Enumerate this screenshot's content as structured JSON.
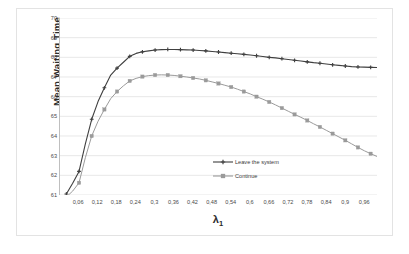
{
  "chart_data": {
    "type": "line",
    "title": "",
    "xlabel": "λ₁",
    "xlabel_base": "λ",
    "xlabel_sub": "1",
    "ylabel": "Mean Waiting Time",
    "xlim": [
      0,
      1.0
    ],
    "ylim": [
      61,
      70
    ],
    "grid": "horizontal",
    "legend_position": "center-right-inside",
    "x_tick_labels": [
      "0,06",
      "0,12",
      "0,18",
      "0,24",
      "0,3",
      "0,36",
      "0,42",
      "0,48",
      "0,54",
      "0,6",
      "0,66",
      "0,72",
      "0,78",
      "0,84",
      "0,9",
      "0,96"
    ],
    "y_tick_labels": [
      "70",
      "69",
      "68",
      "67",
      "66",
      "65",
      "64",
      "63",
      "62",
      "61"
    ],
    "y_ticks": [
      70,
      69,
      68,
      67,
      66,
      65,
      64,
      63,
      62,
      61
    ],
    "x": [
      0.02,
      0.04,
      0.06,
      0.08,
      0.1,
      0.12,
      0.14,
      0.16,
      0.18,
      0.2,
      0.22,
      0.24,
      0.26,
      0.28,
      0.3,
      0.32,
      0.34,
      0.36,
      0.38,
      0.4,
      0.42,
      0.44,
      0.46,
      0.48,
      0.5,
      0.52,
      0.54,
      0.56,
      0.58,
      0.6,
      0.62,
      0.64,
      0.66,
      0.68,
      0.7,
      0.72,
      0.74,
      0.76,
      0.78,
      0.8,
      0.82,
      0.84,
      0.86,
      0.88,
      0.9,
      0.92,
      0.94,
      0.96,
      0.98,
      1.0
    ],
    "series": [
      {
        "name": "Leave the system",
        "color": "#3f3f3f",
        "marker": "cross",
        "values": [
          61.05,
          61.6,
          62.2,
          63.6,
          64.85,
          65.75,
          66.45,
          67.1,
          67.45,
          67.75,
          68.05,
          68.2,
          68.28,
          68.33,
          68.37,
          68.39,
          68.4,
          68.4,
          68.39,
          68.38,
          68.37,
          68.35,
          68.33,
          68.3,
          68.27,
          68.24,
          68.21,
          68.18,
          68.15,
          68.12,
          68.08,
          68.04,
          68.0,
          67.97,
          67.93,
          67.89,
          67.85,
          67.81,
          67.77,
          67.73,
          67.7,
          67.66,
          67.62,
          67.59,
          67.56,
          67.53,
          67.51,
          67.5,
          67.49,
          67.48
        ]
      },
      {
        "name": "Continue",
        "color": "#9a9a9a",
        "marker": "square",
        "values": [
          60.9,
          61.2,
          61.62,
          62.9,
          64.0,
          64.75,
          65.35,
          65.9,
          66.26,
          66.55,
          66.8,
          66.93,
          67.02,
          67.07,
          67.1,
          67.11,
          67.1,
          67.08,
          67.04,
          67.0,
          66.95,
          66.9,
          66.83,
          66.75,
          66.67,
          66.58,
          66.49,
          66.38,
          66.26,
          66.14,
          66.0,
          65.87,
          65.73,
          65.58,
          65.42,
          65.26,
          65.1,
          64.95,
          64.79,
          64.62,
          64.46,
          64.29,
          64.12,
          63.95,
          63.78,
          63.6,
          63.42,
          63.25,
          63.1,
          62.96
        ]
      }
    ]
  },
  "legend": {
    "items": [
      {
        "label": "Leave the system",
        "color": "#3f3f3f",
        "marker": "cross"
      },
      {
        "label": "Continue",
        "color": "#9a9a9a",
        "marker": "square"
      }
    ]
  },
  "colors": {
    "series_leave": "#3f3f3f",
    "series_continue": "#9a9a9a",
    "gridline": "#e8e8e8",
    "axis": "#bfbfbf",
    "frame": "#e3e3e3",
    "text": "#4a4a4a",
    "title_text": "#2b2b2b",
    "background": "#ffffff"
  }
}
